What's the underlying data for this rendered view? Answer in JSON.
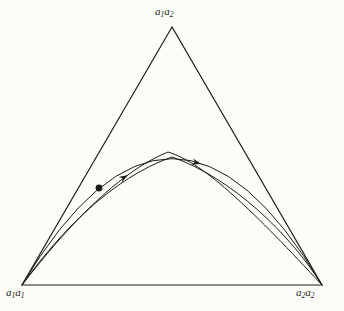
{
  "figure": {
    "type": "de-finetti-simplex-diagram",
    "background_color": "#fdfdf8",
    "stroke_color": "#1a1a18",
    "vertices": {
      "top": {
        "label_html": "a<sub>1</sub>a<sub>2</sub>",
        "label_text": "a1a2",
        "x": 172,
        "y": 27
      },
      "bottom_left": {
        "label_html": "a<sub>1</sub>a<sub>1</sub>",
        "label_text": "a1a1",
        "x": 22,
        "y": 285
      },
      "bottom_right": {
        "label_html": "a<sub>2</sub>a<sub>2</sub>",
        "label_text": "a2a2",
        "x": 322,
        "y": 285
      }
    },
    "curves": [
      {
        "name": "hardy-weinberg-parabola",
        "path": "M 22 285 Q 172 32 322 285",
        "description": "smooth parabolic equilibrium curve spanning both base vertices"
      },
      {
        "name": "trajectory-outer",
        "path": "M 22 285 C 60 232 112 178 172 157 C 232 178 290 234 322 285",
        "description": "trajectory arc lying just inside the parabola"
      },
      {
        "name": "trajectory-kinked",
        "path": "M 22 285 C 66 228 118 172 168 152 C 205 163 256 214 322 285",
        "description": "trajectory with an angular kink at its apex"
      }
    ],
    "markers": {
      "start_point": {
        "name": "start-point-dot",
        "x": 99,
        "y": 188,
        "radius": 3.4
      },
      "arrows": [
        {
          "name": "direction-arrow-left",
          "x": 128,
          "y": 175,
          "angle": -31
        },
        {
          "name": "direction-arrow-right",
          "x": 201,
          "y": 164,
          "angle": 16
        }
      ]
    }
  }
}
